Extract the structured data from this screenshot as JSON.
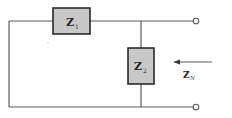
{
  "diagram": {
    "title": "",
    "components": [
      {
        "id": "Z1",
        "label": "Z",
        "subscript": "1",
        "orientation": "horizontal",
        "position": "series-top"
      },
      {
        "id": "Z2",
        "label": "Z",
        "subscript": "2",
        "orientation": "vertical",
        "position": "shunt"
      }
    ],
    "terminals": [
      {
        "id": "top-right"
      },
      {
        "id": "bottom-right"
      }
    ],
    "arrow": {
      "label": "Z",
      "subscript": "N",
      "direction": "left"
    },
    "colors": {
      "wire": "#5a5a5a",
      "box_fill": "#c8c8c8",
      "box_stroke": "#2a2a2a",
      "background": "#ffffff"
    }
  }
}
